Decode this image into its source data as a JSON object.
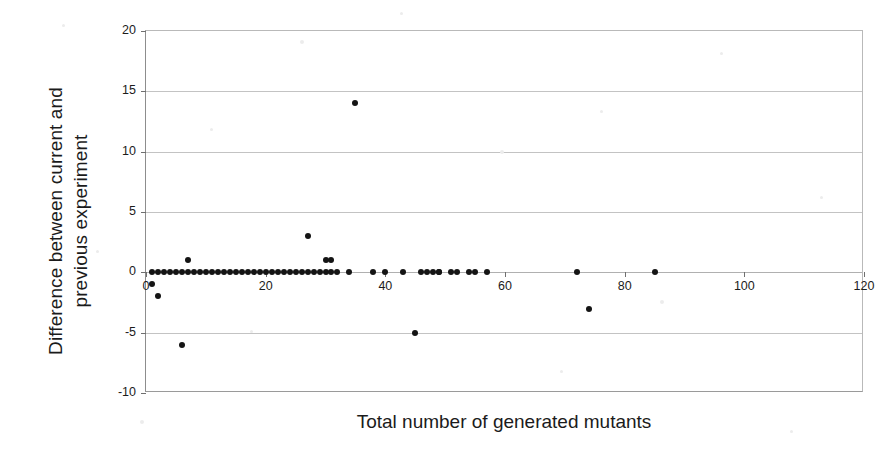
{
  "chart_data": {
    "type": "scatter",
    "title": "",
    "xlabel": "Total number of generated mutants",
    "ylabel": "Difference between current and previous experiment",
    "xlim": [
      0,
      120
    ],
    "ylim": [
      -10,
      20
    ],
    "xticks": [
      0,
      20,
      40,
      60,
      80,
      100,
      120
    ],
    "xtick_labels": [
      "0",
      "20",
      "40",
      "60",
      "80",
      "100",
      "120"
    ],
    "yticks": [
      -10,
      -5,
      0,
      5,
      10,
      15,
      20
    ],
    "ytick_labels": [
      "-10",
      "-5",
      "0",
      "5",
      "10",
      "15",
      "20"
    ],
    "grid": "horizontal",
    "legend": null,
    "marker": "filled-circle",
    "marker_color": "#141414",
    "series": [
      {
        "name": "Difference per mutant count",
        "points": [
          [
            1,
            0
          ],
          [
            1,
            -1
          ],
          [
            2,
            0
          ],
          [
            2,
            -2
          ],
          [
            3,
            0
          ],
          [
            4,
            0
          ],
          [
            5,
            0
          ],
          [
            6,
            0
          ],
          [
            6,
            -6
          ],
          [
            7,
            0
          ],
          [
            7,
            1
          ],
          [
            8,
            0
          ],
          [
            9,
            0
          ],
          [
            10,
            0
          ],
          [
            11,
            0
          ],
          [
            12,
            0
          ],
          [
            13,
            0
          ],
          [
            14,
            0
          ],
          [
            15,
            0
          ],
          [
            16,
            0
          ],
          [
            17,
            0
          ],
          [
            18,
            0
          ],
          [
            19,
            0
          ],
          [
            20,
            0
          ],
          [
            21,
            0
          ],
          [
            22,
            0
          ],
          [
            23,
            0
          ],
          [
            24,
            0
          ],
          [
            25,
            0
          ],
          [
            26,
            0
          ],
          [
            27,
            0
          ],
          [
            27,
            3
          ],
          [
            28,
            0
          ],
          [
            29,
            0
          ],
          [
            30,
            0
          ],
          [
            30,
            1
          ],
          [
            31,
            0
          ],
          [
            31,
            1
          ],
          [
            32,
            0
          ],
          [
            34,
            0
          ],
          [
            35,
            14
          ],
          [
            38,
            0
          ],
          [
            40,
            0
          ],
          [
            43,
            0
          ],
          [
            46,
            0
          ],
          [
            47,
            0
          ],
          [
            48,
            0
          ],
          [
            49,
            0
          ],
          [
            49,
            0
          ],
          [
            51,
            0
          ],
          [
            52,
            0
          ],
          [
            54,
            0
          ],
          [
            55,
            0
          ],
          [
            57,
            0
          ],
          [
            45,
            -5
          ],
          [
            72,
            0
          ],
          [
            74,
            -3
          ],
          [
            85,
            0
          ]
        ]
      }
    ]
  },
  "axes": {
    "x_title": "Total number of generated mutants",
    "y_title": "Difference between current and\nprevious experiment"
  }
}
